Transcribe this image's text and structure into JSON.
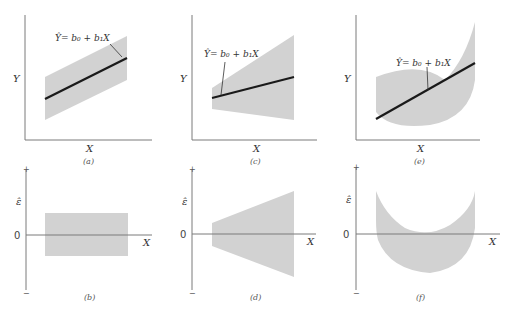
{
  "figure": {
    "equation": "Ŷ= b₀ + b₁X",
    "axis_labels": {
      "x": "X",
      "y": "Y",
      "residual": "ε̂",
      "zero": "0",
      "plus": "+",
      "minus": "−"
    },
    "colors": {
      "band": "#d2d2d2",
      "fit_line": "#1a1a1a",
      "axis": "#7a7a7a"
    },
    "panels": [
      {
        "id": "a",
        "caption": "(a)",
        "type": "scatter-band",
        "shape": "constant-width parallel band around line"
      },
      {
        "id": "c",
        "caption": "(c)",
        "type": "scatter-band",
        "shape": "widening band (funnel) around line"
      },
      {
        "id": "e",
        "caption": "(e)",
        "type": "scatter-band",
        "shape": "curved (U) band around line"
      },
      {
        "id": "b",
        "caption": "(b)",
        "type": "residual-band",
        "shape": "rectangle centered on zero"
      },
      {
        "id": "d",
        "caption": "(d)",
        "type": "residual-band",
        "shape": "widening wedge about zero"
      },
      {
        "id": "f",
        "caption": "(f)",
        "type": "residual-band",
        "shape": "U-shaped curve band"
      }
    ]
  }
}
